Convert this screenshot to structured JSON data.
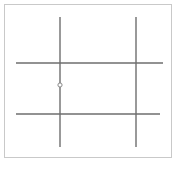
{
  "canvas": {
    "width": 181,
    "height": 169,
    "background_color": "#ffffff"
  },
  "frame": {
    "label": "diagram border frame",
    "x": 4,
    "y": 4,
    "width": 168,
    "height": 154,
    "border_color": "#c9c9c9",
    "border_width": 1,
    "fill_color": "#ffffff"
  },
  "chart_data": {
    "type": "line",
    "title": "",
    "subtitle": "",
    "xlabel": "",
    "ylabel": "",
    "grid": false,
    "legend": "none",
    "xlim": [
      0,
      181
    ],
    "ylim": [
      0,
      169
    ],
    "stroke_color": "#6e6e6e",
    "stroke_width": 1.4,
    "series": [
      {
        "name": "vertical-left",
        "orientation": "vertical",
        "x": 60,
        "y_start": 17,
        "y_end": 147,
        "color": "#6e6e6e",
        "width": 1.4
      },
      {
        "name": "vertical-right",
        "orientation": "vertical",
        "x": 136,
        "y_start": 17,
        "y_end": 147,
        "color": "#6e6e6e",
        "width": 1.4
      },
      {
        "name": "horizontal-upper",
        "orientation": "horizontal",
        "y": 63,
        "x_start": 16,
        "x_end": 163,
        "color": "#6e6e6e",
        "width": 1.4
      },
      {
        "name": "horizontal-lower",
        "orientation": "horizontal",
        "y": 114,
        "x_start": 16,
        "x_end": 160,
        "color": "#6e6e6e",
        "width": 1.4
      }
    ],
    "nodes": [
      {
        "name": "circle-node",
        "x": 60,
        "y": 85,
        "radius": 2.1,
        "fill": "#ffffff",
        "stroke": "#8a8a8a",
        "stroke_width": 1
      }
    ],
    "intersections": [
      {
        "name": "t-junction-upper-left",
        "x": 60,
        "y": 63,
        "kind": "T"
      },
      {
        "name": "cross-upper-right",
        "x": 136,
        "y": 63,
        "kind": "cross"
      },
      {
        "name": "cross-lower-left",
        "x": 60,
        "y": 114,
        "kind": "cross"
      },
      {
        "name": "cross-lower-right",
        "x": 136,
        "y": 114,
        "kind": "cross"
      }
    ]
  }
}
